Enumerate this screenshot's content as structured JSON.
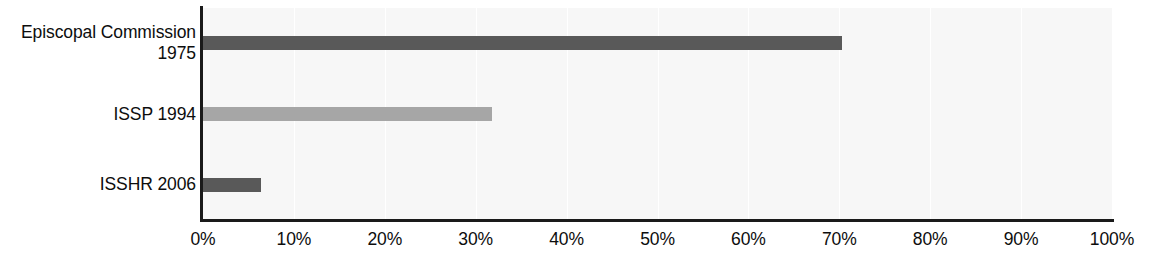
{
  "chart_data": {
    "type": "bar",
    "orientation": "horizontal",
    "title": "",
    "subtitle": "",
    "xlabel": "",
    "ylabel": "",
    "categories": [
      "Episcopal Commission\n1975",
      "ISSP 1994",
      "ISSHR 2006"
    ],
    "values": [
      70.3,
      31.8,
      6.4
    ],
    "value_labels": [
      "",
      "",
      ""
    ],
    "xlim": [
      0,
      100
    ],
    "xticks": [
      0,
      10,
      20,
      30,
      40,
      50,
      60,
      70,
      80,
      90,
      100
    ],
    "xtick_labels": [
      "0%",
      "10%",
      "20%",
      "30%",
      "40%",
      "50%",
      "60%",
      "70%",
      "80%",
      "90%",
      "100%"
    ],
    "grid": true,
    "grid_axis": "x",
    "legend": false,
    "legend_entries": [],
    "bar_colors": [
      "#595959",
      "#a6a6a6",
      "#595959"
    ],
    "plot_background": "#f7f7f7",
    "gridline_color": "#ffffff",
    "axis_color": "#1a1a1a",
    "text_color": "#0d0d0d"
  }
}
